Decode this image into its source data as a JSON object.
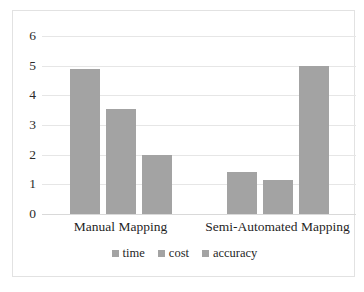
{
  "chart_data": {
    "type": "bar",
    "title": "",
    "subtitle": "",
    "xlabel": "",
    "ylabel": "",
    "categories": [
      "Manual Mapping",
      "Semi-Automated Mapping"
    ],
    "series": [
      {
        "name": "time",
        "values": [
          4.9,
          1.4
        ]
      },
      {
        "name": "cost",
        "values": [
          3.55,
          1.15
        ]
      },
      {
        "name": "accuracy",
        "values": [
          2.0,
          5.0
        ]
      }
    ],
    "ylim": [
      0,
      6
    ],
    "yticks": [
      0,
      1,
      2,
      3,
      4,
      5,
      6
    ],
    "ytick_labels": [
      "0",
      "1",
      "2",
      "3",
      "4",
      "5",
      "6"
    ],
    "grid": true,
    "grid_axis": "y",
    "legend": [
      "time",
      "cost",
      "accuracy"
    ],
    "legend_position": "bottom",
    "bar_color": "#a3a3a3",
    "grid_color": "#e6e6e6",
    "axis_text_color": "#1f1f1f",
    "background": "#ffffff",
    "frame_color": "#e2e2e2"
  }
}
